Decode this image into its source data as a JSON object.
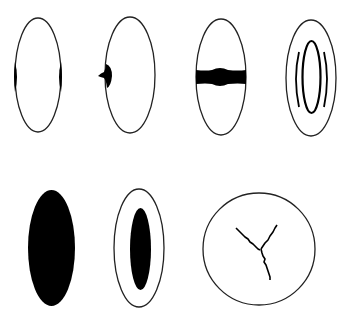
{
  "diagram": {
    "title": "",
    "background": "#ffffff",
    "stroke_color": "#222222",
    "fill_color": "#000000",
    "figures": [
      {
        "id": "fig-1",
        "shape": "ellipse-outline",
        "marking": "equatorial-bulges-both-sides",
        "row": 1,
        "col": 1
      },
      {
        "id": "fig-2",
        "shape": "ellipse-outline",
        "marking": "single-equatorial-nodule-left",
        "row": 1,
        "col": 2
      },
      {
        "id": "fig-3",
        "shape": "ellipse-outline",
        "marking": "horizontal-equatorial-band",
        "row": 1,
        "col": 3
      },
      {
        "id": "fig-4",
        "shape": "ellipse-outline",
        "marking": "inner-ring-with-concentric-arcs",
        "row": 1,
        "col": 4
      },
      {
        "id": "fig-5",
        "shape": "ellipse-filled",
        "marking": "fully-opaque",
        "row": 2,
        "col": 1
      },
      {
        "id": "fig-6",
        "shape": "ellipse-outline",
        "marking": "central-filled-core",
        "row": 2,
        "col": 2
      },
      {
        "id": "fig-7",
        "shape": "circle-outline",
        "marking": "y-shaped-suture",
        "row": 2,
        "col": 3
      }
    ]
  }
}
